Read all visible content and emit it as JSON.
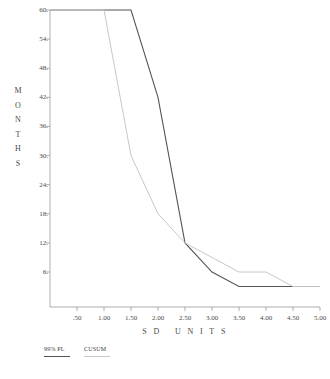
{
  "chart_data": {
    "type": "line",
    "title": "",
    "xlabel": "S D   U N I T S",
    "ylabel": "M O N T H S",
    "xlim": [
      0,
      5.0
    ],
    "ylim": [
      0,
      60
    ],
    "grid": false,
    "legend_position": "below-left",
    "x_ticks": [
      {
        "value": 0.5,
        "label": ".50"
      },
      {
        "value": 1.0,
        "label": "1.00"
      },
      {
        "value": 1.5,
        "label": "1.50"
      },
      {
        "value": 2.0,
        "label": "2.00"
      },
      {
        "value": 2.5,
        "label": "2.50"
      },
      {
        "value": 3.0,
        "label": "3.00"
      },
      {
        "value": 3.5,
        "label": "3.50"
      },
      {
        "value": 4.0,
        "label": "4.00"
      },
      {
        "value": 4.5,
        "label": "4.50"
      },
      {
        "value": 5.0,
        "label": "5.00"
      }
    ],
    "y_ticks": [
      {
        "value": 6,
        "label": "6."
      },
      {
        "value": 12,
        "label": "12."
      },
      {
        "value": 18,
        "label": "18."
      },
      {
        "value": 24,
        "label": "24."
      },
      {
        "value": 30,
        "label": "30."
      },
      {
        "value": 36,
        "label": "36."
      },
      {
        "value": 42,
        "label": "42."
      },
      {
        "value": 48,
        "label": "48."
      },
      {
        "value": 54,
        "label": "54."
      },
      {
        "value": 60,
        "label": "60."
      }
    ],
    "y_axis_title_letters": [
      "M",
      "O",
      "N",
      "T",
      "H",
      "S"
    ],
    "series": [
      {
        "name": "99% PL",
        "color": "#555555",
        "width": 1.1,
        "x": [
          0.0,
          1.5,
          2.0,
          2.5,
          3.0,
          3.5,
          4.5,
          5.0
        ],
        "y": [
          60,
          60,
          42,
          12,
          6,
          3,
          3,
          3
        ]
      },
      {
        "name": "CUSUM",
        "color": "#c8c8c8",
        "width": 1.0,
        "x": [
          0.0,
          1.0,
          1.5,
          2.0,
          2.5,
          3.0,
          3.5,
          4.0,
          4.5,
          5.0
        ],
        "y": [
          60,
          60,
          30,
          18,
          12,
          9,
          6,
          6,
          3,
          3
        ]
      }
    ]
  },
  "legend": {
    "entries": [
      {
        "label": "99% PL",
        "color": "#555555",
        "thickness": "1.4px"
      },
      {
        "label": "CUSUM",
        "color": "#c8c8c8",
        "thickness": "1px"
      }
    ]
  },
  "axes": {
    "axis_color": "#9a9a9a",
    "tick_color": "#9a9a9a"
  }
}
